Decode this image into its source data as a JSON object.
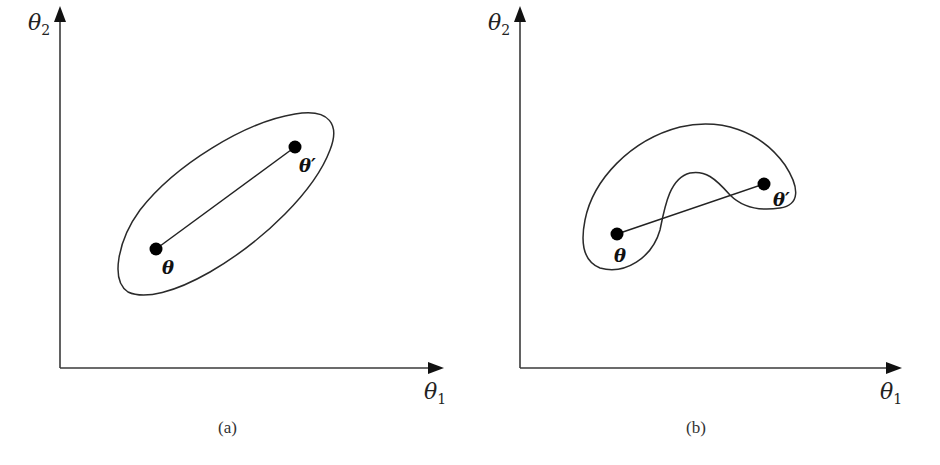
{
  "figure": {
    "panels": [
      {
        "id": "a",
        "caption": "(a)",
        "x_axis_label": "θ",
        "x_axis_sub": "1",
        "y_axis_label": "θ",
        "y_axis_sub": "2",
        "region_shape": "ellipse (convex)",
        "point_1_label": "θ",
        "point_2_label": "θ′"
      },
      {
        "id": "b",
        "caption": "(b)",
        "x_axis_label": "θ",
        "x_axis_sub": "1",
        "y_axis_label": "θ",
        "y_axis_sub": "2",
        "region_shape": "kidney (non-convex)",
        "point_1_label": "θ",
        "point_2_label": "θ′"
      }
    ],
    "colors": {
      "line": "#2a2a2a",
      "point": "#000000",
      "background": "#ffffff"
    }
  }
}
